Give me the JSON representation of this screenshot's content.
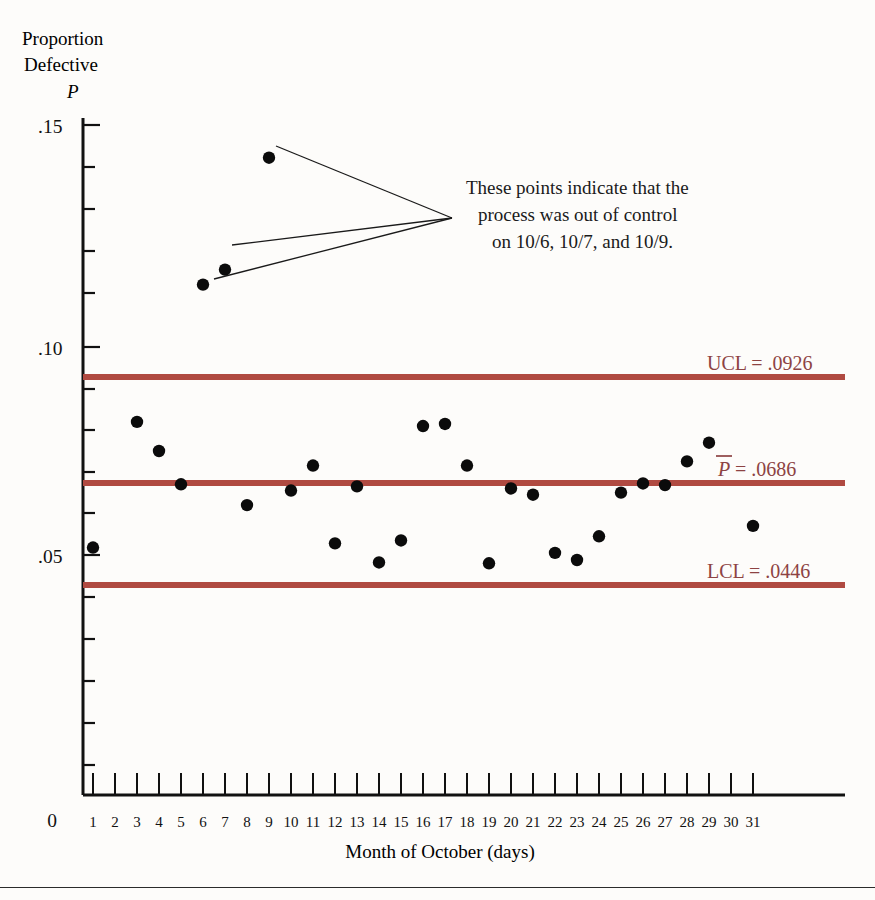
{
  "chart_data": {
    "type": "scatter",
    "title": "",
    "subtitle": "",
    "xlabel": "Month of October (days)",
    "ylabel": "Proportion Defective P",
    "ylabel_lines": [
      "Proportion",
      "Defective",
      "P"
    ],
    "xlim": [
      0,
      31
    ],
    "ylim": [
      0,
      0.15
    ],
    "grid": false,
    "legend": "none",
    "ytick_labels": [
      ".05",
      ".10",
      ".15"
    ],
    "ytick_values": [
      0.05,
      0.1,
      0.15
    ],
    "yminor_step": 0.01,
    "origin_label": "0",
    "xtick_labels": [
      "1",
      "2",
      "3",
      "4",
      "5",
      "6",
      "7",
      "8",
      "9",
      "10",
      "11",
      "12",
      "13",
      "14",
      "15",
      "16",
      "17",
      "18",
      "19",
      "20",
      "21",
      "22",
      "23",
      "24",
      "25",
      "26",
      "27",
      "28",
      "29",
      "30",
      "31"
    ],
    "x": [
      1,
      3,
      4,
      5,
      6,
      7,
      8,
      9,
      10,
      11,
      12,
      13,
      14,
      15,
      16,
      17,
      18,
      19,
      20,
      21,
      22,
      23,
      24,
      25,
      26,
      27,
      28,
      29,
      31
    ],
    "values": [
      0.0518,
      0.082,
      0.075,
      0.067,
      0.115,
      0.1186,
      0.062,
      0.1455,
      0.0655,
      0.0715,
      0.0528,
      0.0665,
      0.0482,
      0.0535,
      0.081,
      0.0815,
      0.0715,
      0.048,
      0.066,
      0.0645,
      0.0505,
      0.0488,
      0.0545,
      0.065,
      0.0672,
      0.0668,
      0.0725,
      0.077,
      0.057
    ],
    "out_of_control_days": [
      6,
      7,
      9
    ],
    "control_limits": {
      "ucl": {
        "value": 0.0926,
        "label": "UCL = .0926"
      },
      "center": {
        "value": 0.0686,
        "label": "P = .0686",
        "symbol": "P",
        "suffix": " = .0686"
      },
      "lcl": {
        "value": 0.0446,
        "label": "LCL = .0446"
      }
    },
    "annotation": {
      "lines": [
        "These points indicate that the",
        "process was out of control",
        "on 10/6, 10/7, and 10/9."
      ],
      "points_referenced": [
        {
          "day": 6,
          "value": 0.115
        },
        {
          "day": 7,
          "value": 0.1186
        },
        {
          "day": 9,
          "value": 0.1455
        }
      ]
    },
    "colors": {
      "limit_line": "#b04a41",
      "limit_label": "#8d4343",
      "data_point": "#0b0b0b",
      "axis": "#111111"
    }
  }
}
